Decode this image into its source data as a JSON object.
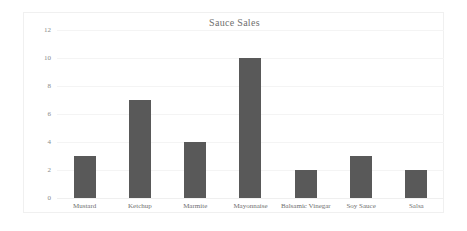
{
  "chart_data": {
    "type": "bar",
    "title": "Sauce Sales",
    "xlabel": "",
    "ylabel": "",
    "categories": [
      "Mustard",
      "Ketchup",
      "Marmite",
      "Mayonnaise",
      "Balsamic Vinegar",
      "Soy Sauce",
      "Salsa"
    ],
    "values": [
      3,
      7,
      4,
      10,
      2,
      3,
      2
    ],
    "ylim": [
      0,
      12
    ],
    "yticks": [
      0,
      2,
      4,
      6,
      8,
      10,
      12
    ],
    "ytick_labels": [
      "0",
      "2",
      "4",
      "6",
      "8",
      "10",
      "12"
    ],
    "grid": true,
    "legend": false,
    "bar_color": "#595959",
    "grid_color": "#f4f4f4",
    "background_color": "#ffffff",
    "text_color": "#6f6f6f"
  }
}
